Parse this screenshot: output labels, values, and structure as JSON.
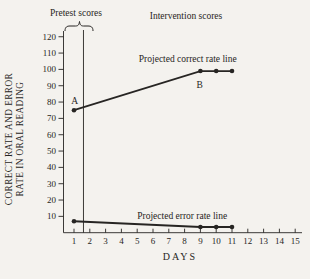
{
  "figure": {
    "background": "#f4f2ee",
    "ink": "#272523"
  },
  "chart_data": {
    "type": "line",
    "title": "",
    "xlabel": "DAYS",
    "ylabel": [
      "CORRECT RATE AND ERROR",
      "RATE IN ORAL READING"
    ],
    "x_ticks": [
      1,
      2,
      3,
      4,
      5,
      6,
      7,
      8,
      9,
      10,
      11,
      12,
      13,
      14,
      15
    ],
    "y_ticks": [
      10,
      20,
      30,
      40,
      50,
      60,
      70,
      80,
      90,
      100,
      110,
      120
    ],
    "xlim": [
      0.3,
      15.6
    ],
    "ylim": [
      0,
      125
    ],
    "grid": false,
    "legend_position": "none",
    "phase_change_day": 1.6,
    "phases": {
      "pretest_label": "Pretest scores",
      "intervention_label": "Intervention scores"
    },
    "series": [
      {
        "name": "Projected correct rate line",
        "x": [
          1,
          9,
          10,
          11
        ],
        "values": [
          75,
          99,
          99,
          99
        ]
      },
      {
        "name": "Projected error rate line",
        "x": [
          1,
          9,
          10,
          11
        ],
        "values": [
          7,
          3.5,
          3.5,
          3.5
        ]
      }
    ],
    "point_labels": [
      {
        "text": "A",
        "day": 1.05,
        "value": 79
      },
      {
        "text": "B",
        "day": 8.95,
        "value": 88.5
      },
      {
        "text": "Projected correct rate line",
        "day": 8.2,
        "value": 104.5
      },
      {
        "text": "Projected error rate line",
        "day": 7.85,
        "value": 8.4
      }
    ]
  }
}
